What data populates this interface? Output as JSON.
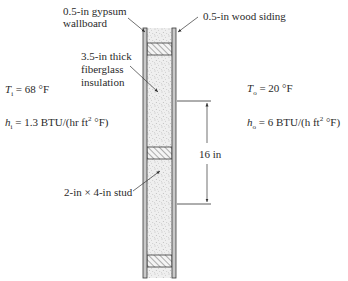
{
  "figure": {
    "labels": {
      "gypsum": "0.5-in gypsum\nwallboard",
      "siding": "0.5-in wood siding",
      "insulation": "3.5-in thick\nfiberglass\ninsulation",
      "stud": "2-in × 4-in stud",
      "spacing": "16 in"
    },
    "inside": {
      "T_symbol": "T",
      "T_sub": "i",
      "T_value": " = 68 °F",
      "h_symbol": "h",
      "h_sub": "i",
      "h_value_a": " = 1.3 BTU/(hr ft",
      "h_sup": "2",
      "h_value_b": " °F)"
    },
    "outside": {
      "T_symbol": "T",
      "T_sub": "o",
      "T_value": " = 20 °F",
      "h_symbol": "h",
      "h_sub": "o",
      "h_value_a": " = 6 BTU/(h ft",
      "h_sup": "2",
      "h_value_b": " °F)"
    },
    "colors": {
      "line": "#3a3a3a",
      "board_fill": "#c8c8c8",
      "insulation_fill": "#ededed",
      "stipple": "#8a8a8a"
    }
  }
}
